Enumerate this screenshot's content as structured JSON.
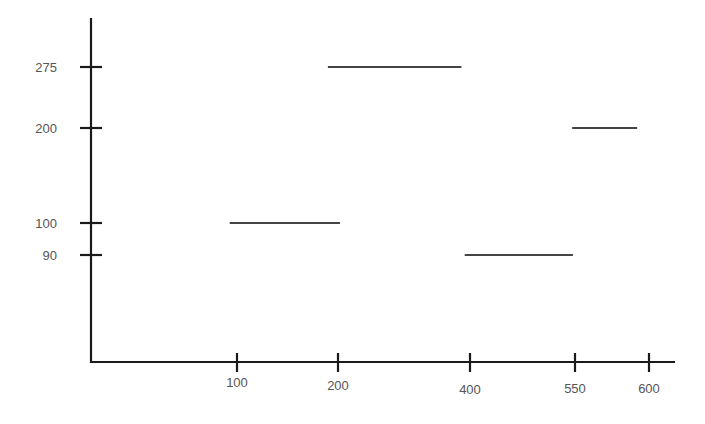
{
  "chart_data": {
    "type": "line",
    "subtype": "step-segments",
    "title": "",
    "xlabel": "",
    "ylabel": "",
    "x_ticks": [
      100,
      200,
      400,
      550,
      600
    ],
    "y_ticks": [
      90,
      100,
      200,
      275
    ],
    "x_tick_labels": [
      "100",
      "200",
      "400",
      "550",
      "600"
    ],
    "y_tick_labels": [
      "90",
      "100",
      "200",
      "275"
    ],
    "grid": false,
    "legend": null,
    "segments": [
      {
        "x_start": 95,
        "x_end": 203,
        "y": 100
      },
      {
        "x_start": 190,
        "x_end": 387,
        "y": 275
      },
      {
        "x_start": 392,
        "x_end": 547,
        "y": 90
      },
      {
        "x_start": 546,
        "x_end": 592,
        "y": 200
      }
    ]
  },
  "style": {
    "axis_color": "#1a1a1a",
    "segment_color": "#444444",
    "label_color": "#555555"
  }
}
